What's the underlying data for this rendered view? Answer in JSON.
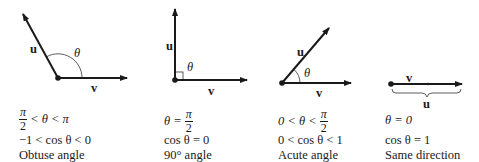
{
  "panels": [
    {
      "id": "obtuse",
      "vector_labels": {
        "u": "u",
        "v": "v"
      },
      "angle_symbol": "θ",
      "condition": {
        "left_num": "π",
        "left_den": "2",
        "mid": "< θ < π"
      },
      "cos_range": "−1 < cos θ < 0",
      "caption": "Obtuse angle"
    },
    {
      "id": "right",
      "vector_labels": {
        "u": "u",
        "v": "v"
      },
      "angle_symbol": "θ",
      "condition": {
        "prefix": "θ =",
        "right_num": "π",
        "right_den": "2"
      },
      "cos_range": "cos θ = 0",
      "caption": "90° angle"
    },
    {
      "id": "acute",
      "vector_labels": {
        "u": "u",
        "v": "v"
      },
      "angle_symbol": "θ",
      "condition": {
        "prefix": "0 < θ <",
        "right_num": "π",
        "right_den": "2"
      },
      "cos_range": "0 < cos θ < 1",
      "caption": "Acute angle"
    },
    {
      "id": "same",
      "vector_labels": {
        "u": "u",
        "v": "v"
      },
      "condition": {
        "text": "θ = 0"
      },
      "cos_range": "cos θ = 1",
      "caption": "Same direction"
    }
  ],
  "colors": {
    "ink": "#1a1a1a",
    "background": "#ffffff"
  }
}
